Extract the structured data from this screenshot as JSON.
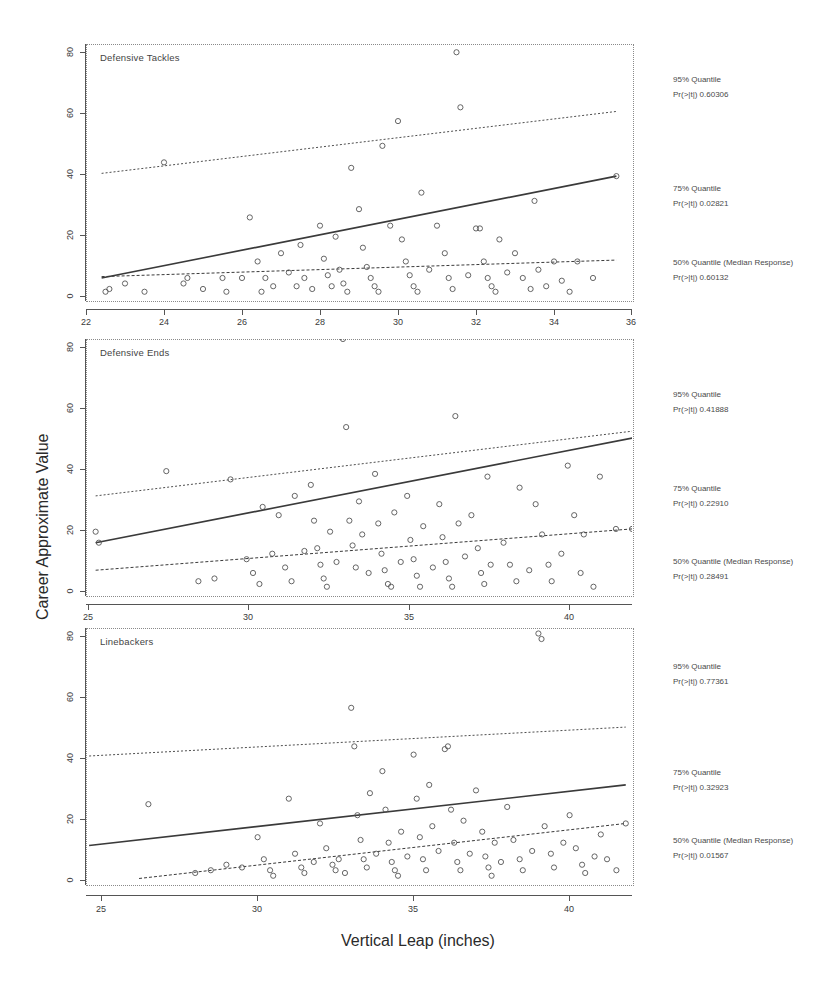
{
  "figure": {
    "xlabel": "Vertical Leap (inches)",
    "ylabel": "Career Approximate Value"
  },
  "chart_data": [
    {
      "type": "scatter",
      "title": "Defensive Tackles",
      "xlabel": "Vertical Leap (inches)",
      "ylabel": "Career Approximate Value",
      "xlim": [
        22,
        36
      ],
      "ylim": [
        -3,
        90
      ],
      "xticks": [
        22,
        24,
        26,
        28,
        30,
        32,
        34,
        36
      ],
      "yticks": [
        0,
        20,
        40,
        60,
        80
      ],
      "grid": false,
      "legend_position": "right-outside",
      "annotations": [
        {
          "quantile_label": "95% Quantile",
          "pvalue_label": "Pr(>|t|)   0.60306",
          "pvalue": 0.60306
        },
        {
          "quantile_label": "75% Quantile",
          "pvalue_label": "Pr(>|t|)  0.02821",
          "pvalue": 0.02821
        },
        {
          "quantile_label": "50% Quantile (Median Response)",
          "pvalue_label": "Pr(>|t|)  0.60132",
          "pvalue": 0.60132
        }
      ],
      "fit_lines": [
        {
          "name": "95% Quantile",
          "x": [
            22.4,
            35.6
          ],
          "y": [
            43.0,
            65.5
          ]
        },
        {
          "name": "75% Quantile",
          "x": [
            22.4,
            35.6
          ],
          "y": [
            5.0,
            42.0
          ]
        },
        {
          "name": "50% Quantile (Median Response)",
          "x": [
            22.4,
            35.6
          ],
          "y": [
            5.5,
            11.5
          ]
        }
      ],
      "points": [
        [
          22.5,
          0
        ],
        [
          22.6,
          1
        ],
        [
          23.0,
          3
        ],
        [
          23.5,
          0
        ],
        [
          24.0,
          47
        ],
        [
          24.5,
          3
        ],
        [
          24.6,
          5
        ],
        [
          25.0,
          1
        ],
        [
          25.5,
          5
        ],
        [
          25.6,
          0
        ],
        [
          26.0,
          5
        ],
        [
          26.2,
          27
        ],
        [
          26.4,
          11
        ],
        [
          26.5,
          0
        ],
        [
          26.6,
          5
        ],
        [
          26.8,
          2
        ],
        [
          27.0,
          14
        ],
        [
          27.2,
          7
        ],
        [
          27.4,
          2
        ],
        [
          27.5,
          17
        ],
        [
          27.6,
          5
        ],
        [
          27.8,
          1
        ],
        [
          28.0,
          24
        ],
        [
          28.1,
          12
        ],
        [
          28.2,
          6
        ],
        [
          28.3,
          2
        ],
        [
          28.4,
          20
        ],
        [
          28.5,
          8
        ],
        [
          28.6,
          3
        ],
        [
          28.7,
          0
        ],
        [
          28.8,
          45
        ],
        [
          29.0,
          30
        ],
        [
          29.1,
          16
        ],
        [
          29.2,
          9
        ],
        [
          29.3,
          5
        ],
        [
          29.4,
          2
        ],
        [
          29.5,
          0
        ],
        [
          29.6,
          53
        ],
        [
          29.8,
          24
        ],
        [
          30.0,
          62
        ],
        [
          30.1,
          19
        ],
        [
          30.2,
          11
        ],
        [
          30.3,
          6
        ],
        [
          30.4,
          2
        ],
        [
          30.5,
          0
        ],
        [
          30.6,
          36
        ],
        [
          30.8,
          8
        ],
        [
          31.0,
          24
        ],
        [
          31.2,
          14
        ],
        [
          31.3,
          5
        ],
        [
          31.4,
          1
        ],
        [
          31.5,
          87
        ],
        [
          31.6,
          67
        ],
        [
          31.8,
          6
        ],
        [
          32.0,
          23
        ],
        [
          32.1,
          23
        ],
        [
          32.2,
          11
        ],
        [
          32.3,
          5
        ],
        [
          32.4,
          2
        ],
        [
          32.5,
          0
        ],
        [
          32.6,
          19
        ],
        [
          32.8,
          7
        ],
        [
          33.0,
          14
        ],
        [
          33.2,
          5
        ],
        [
          33.4,
          1
        ],
        [
          33.5,
          33
        ],
        [
          33.6,
          8
        ],
        [
          33.8,
          2
        ],
        [
          34.0,
          11
        ],
        [
          34.2,
          4
        ],
        [
          34.4,
          0
        ],
        [
          34.6,
          11
        ],
        [
          35.0,
          5
        ],
        [
          35.6,
          42
        ]
      ]
    },
    {
      "type": "scatter",
      "title": "Defensive Ends",
      "xlabel": "Vertical Leap (inches)",
      "ylabel": "Career Approximate Value",
      "xlim": [
        25,
        42
      ],
      "ylim": [
        -3,
        90
      ],
      "xticks": [
        25,
        30,
        35,
        40
      ],
      "yticks": [
        0,
        20,
        40,
        60,
        80
      ],
      "grid": false,
      "legend_position": "right-outside",
      "annotations": [
        {
          "quantile_label": "95% Quantile",
          "pvalue_label": "Pr(>|t|)   0.41888",
          "pvalue": 0.41888
        },
        {
          "quantile_label": "75% Quantile",
          "pvalue_label": "Pr(>|t|)   0.22910",
          "pvalue": 0.2291
        },
        {
          "quantile_label": "50% Quantile (Median Response)",
          "pvalue_label": "Pr(>|t|)  0.28491",
          "pvalue": 0.28491
        }
      ],
      "fit_lines": [
        {
          "name": "95% Quantile",
          "x": [
            25.3,
            42.0
          ],
          "y": [
            33.0,
            56.5
          ]
        },
        {
          "name": "75% Quantile",
          "x": [
            25.3,
            42.0
          ],
          "y": [
            16.0,
            54.0
          ]
        },
        {
          "name": "50% Quantile (Median Response)",
          "x": [
            25.3,
            42.0
          ],
          "y": [
            6.0,
            21.0
          ]
        }
      ],
      "points": [
        [
          25.3,
          20
        ],
        [
          25.4,
          16
        ],
        [
          27.5,
          42
        ],
        [
          28.5,
          2
        ],
        [
          29.0,
          3
        ],
        [
          29.5,
          39
        ],
        [
          30.0,
          10
        ],
        [
          30.2,
          5
        ],
        [
          30.4,
          1
        ],
        [
          30.5,
          29
        ],
        [
          30.8,
          12
        ],
        [
          31.0,
          26
        ],
        [
          31.2,
          7
        ],
        [
          31.4,
          2
        ],
        [
          31.5,
          33
        ],
        [
          31.8,
          13
        ],
        [
          32.0,
          37
        ],
        [
          32.1,
          24
        ],
        [
          32.2,
          14
        ],
        [
          32.3,
          8
        ],
        [
          32.4,
          3
        ],
        [
          32.5,
          0
        ],
        [
          32.6,
          20
        ],
        [
          32.8,
          9
        ],
        [
          33.0,
          90
        ],
        [
          33.1,
          58
        ],
        [
          33.2,
          24
        ],
        [
          33.3,
          15
        ],
        [
          33.4,
          7
        ],
        [
          33.5,
          31
        ],
        [
          33.6,
          19
        ],
        [
          33.8,
          5
        ],
        [
          34.0,
          41
        ],
        [
          34.1,
          23
        ],
        [
          34.2,
          12
        ],
        [
          34.3,
          6
        ],
        [
          34.4,
          1
        ],
        [
          34.5,
          0
        ],
        [
          34.6,
          27
        ],
        [
          34.8,
          9
        ],
        [
          35.0,
          33
        ],
        [
          35.1,
          17
        ],
        [
          35.2,
          10
        ],
        [
          35.3,
          4
        ],
        [
          35.4,
          0
        ],
        [
          35.5,
          22
        ],
        [
          35.8,
          7
        ],
        [
          36.0,
          30
        ],
        [
          36.1,
          18
        ],
        [
          36.2,
          9
        ],
        [
          36.3,
          3
        ],
        [
          36.4,
          0
        ],
        [
          36.5,
          62
        ],
        [
          36.6,
          23
        ],
        [
          36.8,
          11
        ],
        [
          37.0,
          26
        ],
        [
          37.2,
          14
        ],
        [
          37.3,
          5
        ],
        [
          37.4,
          1
        ],
        [
          37.5,
          40
        ],
        [
          37.6,
          8
        ],
        [
          38.0,
          16
        ],
        [
          38.2,
          8
        ],
        [
          38.4,
          2
        ],
        [
          38.5,
          36
        ],
        [
          38.8,
          6
        ],
        [
          39.0,
          30
        ],
        [
          39.2,
          19
        ],
        [
          39.4,
          8
        ],
        [
          39.5,
          2
        ],
        [
          39.8,
          12
        ],
        [
          40.0,
          44
        ],
        [
          40.2,
          26
        ],
        [
          40.4,
          5
        ],
        [
          40.5,
          19
        ],
        [
          40.8,
          0
        ],
        [
          41.0,
          40
        ],
        [
          41.5,
          21
        ],
        [
          42.0,
          21
        ]
      ]
    },
    {
      "type": "scatter",
      "title": "Linebackers",
      "xlabel": "Vertical Leap (inches)",
      "ylabel": "Career Approximate Value",
      "xlim": [
        24.5,
        42
      ],
      "ylim": [
        -3,
        90
      ],
      "xticks": [
        25,
        30,
        35,
        40
      ],
      "yticks": [
        0,
        20,
        40,
        60,
        80
      ],
      "grid": false,
      "legend_position": "right-outside",
      "annotations": [
        {
          "quantile_label": "95% Quantile",
          "pvalue_label": "Pr(>|t|)   0.77361",
          "pvalue": 0.77361
        },
        {
          "quantile_label": "75% Quantile",
          "pvalue_label": "Pr(>|t|)   0.32923",
          "pvalue": 0.32923
        },
        {
          "quantile_label": "50% Quantile (Median Response)",
          "pvalue_label": "Pr(>|t|)  0.01567",
          "pvalue": 0.01567
        }
      ],
      "fit_lines": [
        {
          "name": "95% Quantile",
          "x": [
            24.6,
            41.8
          ],
          "y": [
            43.5,
            54.0
          ]
        },
        {
          "name": "75% Quantile",
          "x": [
            24.6,
            41.8
          ],
          "y": [
            11.0,
            33.0
          ]
        },
        {
          "name": "50% Quantile (Median Response)",
          "x": [
            26.2,
            41.8
          ],
          "y": [
            -1.0,
            19.0
          ]
        }
      ],
      "points": [
        [
          26.5,
          26
        ],
        [
          28.0,
          1
        ],
        [
          28.5,
          2
        ],
        [
          29.0,
          4
        ],
        [
          29.5,
          3
        ],
        [
          30.0,
          14
        ],
        [
          30.2,
          6
        ],
        [
          30.4,
          2
        ],
        [
          30.5,
          0
        ],
        [
          31.0,
          28
        ],
        [
          31.2,
          8
        ],
        [
          31.4,
          3
        ],
        [
          31.5,
          1
        ],
        [
          31.8,
          5
        ],
        [
          32.0,
          19
        ],
        [
          32.2,
          10
        ],
        [
          32.4,
          4
        ],
        [
          32.5,
          2
        ],
        [
          32.6,
          6
        ],
        [
          32.8,
          1
        ],
        [
          33.0,
          61
        ],
        [
          33.1,
          47
        ],
        [
          33.2,
          22
        ],
        [
          33.3,
          13
        ],
        [
          33.4,
          6
        ],
        [
          33.5,
          3
        ],
        [
          33.6,
          30
        ],
        [
          33.8,
          8
        ],
        [
          34.0,
          38
        ],
        [
          34.1,
          24
        ],
        [
          34.2,
          12
        ],
        [
          34.3,
          5
        ],
        [
          34.4,
          2
        ],
        [
          34.5,
          0
        ],
        [
          34.6,
          16
        ],
        [
          34.8,
          7
        ],
        [
          35.0,
          44
        ],
        [
          35.1,
          28
        ],
        [
          35.2,
          14
        ],
        [
          35.3,
          6
        ],
        [
          35.4,
          2
        ],
        [
          35.5,
          33
        ],
        [
          35.6,
          18
        ],
        [
          35.8,
          9
        ],
        [
          36.0,
          46
        ],
        [
          36.1,
          47
        ],
        [
          36.2,
          24
        ],
        [
          36.3,
          12
        ],
        [
          36.4,
          5
        ],
        [
          36.5,
          2
        ],
        [
          36.6,
          20
        ],
        [
          36.8,
          8
        ],
        [
          37.0,
          31
        ],
        [
          37.2,
          16
        ],
        [
          37.3,
          7
        ],
        [
          37.4,
          3
        ],
        [
          37.5,
          0
        ],
        [
          37.6,
          12
        ],
        [
          37.8,
          5
        ],
        [
          38.0,
          25
        ],
        [
          38.2,
          13
        ],
        [
          38.4,
          6
        ],
        [
          38.5,
          2
        ],
        [
          38.8,
          9
        ],
        [
          39.0,
          88
        ],
        [
          39.1,
          86
        ],
        [
          39.2,
          18
        ],
        [
          39.4,
          8
        ],
        [
          39.5,
          3
        ],
        [
          39.8,
          12
        ],
        [
          40.0,
          22
        ],
        [
          40.2,
          10
        ],
        [
          40.4,
          4
        ],
        [
          40.5,
          1
        ],
        [
          40.8,
          7
        ],
        [
          41.0,
          15
        ],
        [
          41.2,
          6
        ],
        [
          41.5,
          2
        ],
        [
          41.8,
          19
        ]
      ]
    }
  ]
}
